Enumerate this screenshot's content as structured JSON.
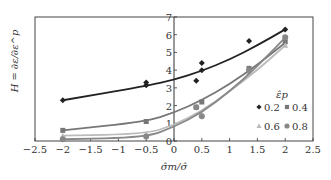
{
  "chart_data": {
    "type": "scatter",
    "title": "",
    "xlabel": "σ̂m/σ̂",
    "ylabel": "H = ∂ε/∂ε^p",
    "xlim": [
      -2.5,
      2.5
    ],
    "ylim": [
      0,
      7
    ],
    "xticks": [
      -2.5,
      -2,
      -1.5,
      -1,
      -0.5,
      0,
      0.5,
      1,
      1.5,
      2,
      2.5
    ],
    "xtick_labels": [
      "−2.5",
      "−2",
      "−1.5",
      "−1",
      "−0.5",
      "0",
      "0.5",
      "1",
      "1.5",
      "2",
      "2.5"
    ],
    "yticks": [
      0,
      1,
      2,
      3,
      4,
      5,
      6,
      7
    ],
    "ytick_labels": [
      "0",
      "1",
      "2",
      "3",
      "4",
      "5",
      "6",
      "7"
    ],
    "grid": false,
    "legend": {
      "title": "ε̂p",
      "position": "lower right",
      "entries": [
        "0.2",
        "0.4",
        "0.6",
        "0.8"
      ]
    },
    "series": [
      {
        "name": "0.2",
        "marker": "diamond",
        "color": "#222222",
        "points": [
          [
            -2,
            2.3
          ],
          [
            -0.5,
            3.15
          ],
          [
            -0.5,
            3.3
          ],
          [
            0.4,
            3.4
          ],
          [
            0.5,
            4.0
          ],
          [
            0.5,
            4.4
          ],
          [
            1.35,
            5.65
          ],
          [
            2,
            6.3
          ]
        ],
        "fit": [
          [
            -2,
            2.3
          ],
          [
            -0.5,
            3.1
          ],
          [
            0,
            3.45
          ],
          [
            0.5,
            3.95
          ],
          [
            1,
            4.6
          ],
          [
            1.5,
            5.4
          ],
          [
            2,
            6.3
          ]
        ]
      },
      {
        "name": "0.4",
        "marker": "square",
        "color": "#777777",
        "points": [
          [
            -2,
            0.6
          ],
          [
            -0.5,
            1.1
          ],
          [
            0.4,
            1.9
          ],
          [
            0.5,
            2.2
          ],
          [
            1.35,
            4.1
          ],
          [
            2,
            5.6
          ]
        ],
        "fit": [
          [
            -2,
            0.6
          ],
          [
            -0.5,
            1.1
          ],
          [
            0,
            1.6
          ],
          [
            0.5,
            2.3
          ],
          [
            1,
            3.2
          ],
          [
            1.5,
            4.3
          ],
          [
            2,
            5.55
          ]
        ]
      },
      {
        "name": "0.6",
        "marker": "triangle",
        "color": "#bbbbbb",
        "points": [
          [
            -2,
            0.3
          ],
          [
            -0.5,
            0.4
          ],
          [
            0.5,
            1.5
          ],
          [
            1.35,
            3.9
          ],
          [
            2,
            5.4
          ]
        ],
        "fit": [
          [
            -2,
            0.3
          ],
          [
            -0.5,
            0.4
          ],
          [
            0,
            0.9
          ],
          [
            0.5,
            1.7
          ],
          [
            1,
            2.8
          ],
          [
            1.5,
            4.0
          ],
          [
            2,
            5.4
          ]
        ]
      },
      {
        "name": "0.8",
        "marker": "circle",
        "color": "#888888",
        "points": [
          [
            -2,
            0.1
          ],
          [
            -0.5,
            0.25
          ],
          [
            0.4,
            1.9
          ],
          [
            0.5,
            1.4
          ],
          [
            1.35,
            4.0
          ],
          [
            2,
            5.85
          ]
        ],
        "fit": [
          [
            -2,
            0.1
          ],
          [
            -0.5,
            0.2
          ],
          [
            0,
            0.8
          ],
          [
            0.5,
            1.6
          ],
          [
            1,
            2.8
          ],
          [
            1.5,
            4.2
          ],
          [
            2,
            5.85
          ]
        ]
      }
    ]
  }
}
